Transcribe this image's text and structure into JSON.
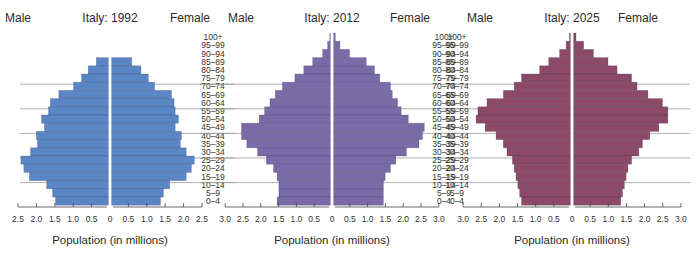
{
  "chart_data": [
    {
      "type": "bar",
      "subtype": "population-pyramid",
      "title": "Italy: 1992",
      "left_label": "Male",
      "right_label": "Female",
      "xlabel": "Population (in millions)",
      "xlim": [
        0,
        2.5
      ],
      "xticks": [
        "2.5",
        "2.0",
        "1.5",
        "1.0",
        "0.5",
        "0",
        "0.5",
        "1.0",
        "1.5",
        "2.0",
        "2.5"
      ],
      "color": "#5b86c5",
      "categories": [
        "100+",
        "95–99",
        "90–94",
        "85–89",
        "80–84",
        "75–79",
        "70–74",
        "65–69",
        "60–64",
        "55–59",
        "50–54",
        "45–49",
        "40–44",
        "35–39",
        "30–34",
        "25–29",
        "20–24",
        "15–19",
        "10–14",
        "5–9",
        "0–4"
      ],
      "series": [
        {
          "name": "Male",
          "values": [
            0,
            0,
            0,
            0.33,
            0.55,
            0.73,
            0.95,
            1.35,
            1.58,
            1.63,
            1.82,
            1.74,
            1.96,
            1.93,
            2.12,
            2.38,
            2.3,
            2.15,
            1.68,
            1.52,
            1.44
          ]
        },
        {
          "name": "Female",
          "values": [
            0,
            0,
            0,
            0.55,
            0.8,
            1.0,
            1.17,
            1.63,
            1.7,
            1.73,
            1.82,
            1.73,
            1.9,
            1.87,
            2.03,
            2.25,
            2.17,
            2.03,
            1.58,
            1.41,
            1.33
          ]
        }
      ]
    },
    {
      "type": "bar",
      "subtype": "population-pyramid",
      "title": "Italy: 2012",
      "left_label": "Male",
      "right_label": "Female",
      "xlabel": "Population (in millions)",
      "xlim": [
        0,
        3.0
      ],
      "xticks": [
        "3.0",
        "2.5",
        "2.0",
        "1.5",
        "1.0",
        "0.5",
        "0",
        "0.5",
        "1.0",
        "1.5",
        "2.0",
        "2.5",
        "3.0"
      ],
      "color": "#7a6aa8",
      "categories": [
        "100+",
        "95–99",
        "90–94",
        "85–89",
        "80–84",
        "75–79",
        "70–74",
        "65–69",
        "60–64",
        "55–59",
        "50–54",
        "45–49",
        "40–44",
        "35–39",
        "30–34",
        "25–29",
        "20–24",
        "15–19",
        "10–14",
        "5–9",
        "0–4"
      ],
      "series": [
        {
          "name": "Male",
          "values": [
            0.02,
            0.08,
            0.22,
            0.5,
            0.75,
            1.0,
            1.35,
            1.55,
            1.7,
            1.85,
            2.0,
            2.5,
            2.5,
            2.35,
            2.05,
            1.8,
            1.6,
            1.5,
            1.45,
            1.45,
            1.5
          ]
        },
        {
          "name": "Female",
          "values": [
            0.05,
            0.18,
            0.45,
            0.92,
            1.15,
            1.3,
            1.6,
            1.65,
            1.8,
            1.9,
            2.1,
            2.55,
            2.5,
            2.4,
            2.05,
            1.75,
            1.6,
            1.45,
            1.4,
            1.4,
            1.4
          ]
        }
      ]
    },
    {
      "type": "bar",
      "subtype": "population-pyramid",
      "title": "Italy: 2025",
      "left_label": "Male",
      "right_label": "Female",
      "xlabel": "Population (in millions)",
      "xlim": [
        0,
        3.0
      ],
      "xticks": [
        "3.0",
        "2.5",
        "2.0",
        "1.5",
        "1.0",
        "0.5",
        "0",
        "0.5",
        "1.0",
        "1.5",
        "2.0",
        "2.5",
        "3.0"
      ],
      "color": "#8c4a68",
      "categories": [
        "100+",
        "95–99",
        "90–94",
        "85–89",
        "80–84",
        "75–79",
        "70–74",
        "65–69",
        "60–64",
        "55–59",
        "50–54",
        "45–49",
        "40–44",
        "35–39",
        "30–34",
        "25–29",
        "20–24",
        "15–19",
        "10–14",
        "5–9",
        "0–4"
      ],
      "series": [
        {
          "name": "Male",
          "values": [
            0.03,
            0.12,
            0.3,
            0.6,
            0.85,
            1.35,
            1.55,
            1.85,
            2.3,
            2.55,
            2.6,
            2.35,
            2.05,
            1.85,
            1.75,
            1.6,
            1.55,
            1.5,
            1.45,
            1.4,
            1.35
          ]
        },
        {
          "name": "Female",
          "values": [
            0.07,
            0.28,
            0.55,
            0.95,
            1.2,
            1.6,
            1.75,
            2.05,
            2.45,
            2.6,
            2.6,
            2.35,
            2.1,
            1.9,
            1.8,
            1.6,
            1.5,
            1.45,
            1.4,
            1.35,
            1.3
          ]
        }
      ]
    }
  ]
}
